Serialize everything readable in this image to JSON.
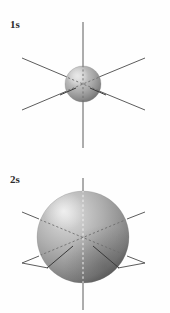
{
  "figure": {
    "title_text": "",
    "background_color": "#ffffff",
    "width": 170,
    "height": 313
  },
  "panels": [
    {
      "id": "1s",
      "label": "1s",
      "orbital_name": "1s",
      "shape": "sphere",
      "sphere": {
        "center_x": 83,
        "center_y": 84,
        "radius": 18,
        "fill_light": "#d9d9d9",
        "fill_mid": "#a8a8a8",
        "fill_dark": "#707070",
        "highlight_color": "#e8e8e8",
        "shadow_color": "#5e5e5e"
      },
      "axes": {
        "count": 3,
        "vertical": {
          "x1": 83,
          "y1": 22,
          "x2": 83,
          "y2": 148
        },
        "diag_down_right": {
          "x1": 22,
          "y1": 58,
          "x2": 145,
          "y2": 110
        },
        "diag_up_right": {
          "x1": 22,
          "y1": 110,
          "x2": 145,
          "y2": 58
        },
        "stroke_color": "#4a4a4a",
        "hidden_style": "dashed"
      }
    },
    {
      "id": "2s",
      "label": "2s",
      "orbital_name": "2s",
      "shape": "sphere",
      "sphere": {
        "center_x": 83,
        "center_y": 237,
        "radius": 46,
        "fill_light": "#d2d2d2",
        "fill_mid": "#a3a3a3",
        "fill_dark": "#6a6a6a",
        "highlight_color": "#ebebeb",
        "shadow_color": "#545454"
      },
      "axes": {
        "count": 3,
        "vertical": {
          "x1": 83,
          "y1": 178,
          "x2": 83,
          "y2": 310
        },
        "diag_down_right": {
          "x1": 22,
          "y1": 212,
          "x2": 145,
          "y2": 263
        },
        "diag_up_right": {
          "x1": 22,
          "y1": 263,
          "x2": 145,
          "y2": 212
        },
        "stroke_color": "#4a4a4a",
        "hidden_style": "dashed"
      }
    }
  ],
  "colors": {
    "background": "#ffffff",
    "label_text": "#2b2b2b",
    "axis": "#4a4a4a",
    "axis_hidden": "#6e6e6e",
    "sphere_light": "#d9d9d9",
    "sphere_dark": "#6a6a6a"
  }
}
